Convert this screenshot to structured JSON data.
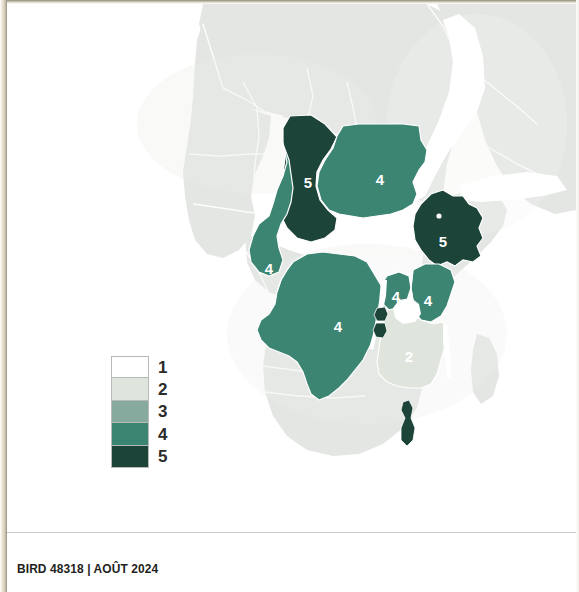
{
  "footer": {
    "text": "BIRD 48318  |  AOÛT 2024",
    "bird_number": "BIRD 48318",
    "date": "AOÛT 2024"
  },
  "legend": {
    "name": "choropleth-legend",
    "orientation": "vertical",
    "items": [
      {
        "label": "1",
        "color": "#ffffff"
      },
      {
        "label": "2",
        "color": "#dfe4dd"
      },
      {
        "label": "3",
        "color": "#86aa9d"
      },
      {
        "label": "4",
        "color": "#3d8573"
      },
      {
        "label": "5",
        "color": "#1d4438"
      }
    ]
  },
  "map": {
    "type": "choropleth",
    "region": "Africa",
    "background_land_color": "#e3e6e2",
    "border_color": "#ffffff",
    "water_color": "#ffffff",
    "no_data_color": "#e3e6e2",
    "features": [
      {
        "name": "Chad",
        "value": "5",
        "color": "#1d4438",
        "label": "5",
        "label_x": 301,
        "label_y": 178
      },
      {
        "name": "Sudan",
        "value": "4",
        "color": "#3d8573",
        "label": "4",
        "label_x": 373,
        "label_y": 175
      },
      {
        "name": "Ethiopia",
        "value": "5",
        "color": "#1d4438",
        "label": "5",
        "label_x": 435,
        "label_y": 237
      },
      {
        "name": "Cameroon",
        "value": "4",
        "color": "#3d8573",
        "label": "4",
        "label_x": 262,
        "label_y": 264
      },
      {
        "name": "Congo, Dem. Rep.",
        "value": "4",
        "color": "#3d8573",
        "label": "4",
        "label_x": 331,
        "label_y": 322
      },
      {
        "name": "Uganda",
        "value": "4",
        "color": "#3d8573",
        "label": "4",
        "label_x": 388,
        "label_y": 292
      },
      {
        "name": "Kenya",
        "value": "4",
        "color": "#3d8573",
        "label": "4",
        "label_x": 420,
        "label_y": 296
      },
      {
        "name": "Tanzania",
        "value": "2",
        "color": "#dfe4dd",
        "label": "2",
        "label_x": 401,
        "label_y": 352
      },
      {
        "name": "Rwanda",
        "value": "5",
        "color": "#1d4438",
        "label": "",
        "label_x": 0,
        "label_y": 0
      },
      {
        "name": "Burundi",
        "value": "5",
        "color": "#1d4438",
        "label": "",
        "label_x": 0,
        "label_y": 0
      },
      {
        "name": "Malawi",
        "value": "5",
        "color": "#1d4438",
        "label": "",
        "label_x": 0,
        "label_y": 0
      }
    ]
  }
}
